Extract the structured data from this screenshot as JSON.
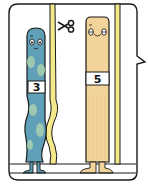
{
  "panel": {
    "type": "comic-illustration",
    "frame": "speech-bubble-panel",
    "colors": {
      "outline": "#1a1a1a",
      "pole": "#f3e98a",
      "blue_body": "#5f9fb8",
      "blue_spots": "#9ec9b0",
      "tan_body": "#f2d49a",
      "tan_stripes": "#e9c383",
      "background": "#ffffff"
    }
  },
  "characters": [
    {
      "name": "blue-wavy-character",
      "number": "3",
      "shape": "wavy"
    },
    {
      "name": "tan-straight-character",
      "number": "5",
      "shape": "straight"
    }
  ],
  "icons": {
    "scissors": "scissors-icon"
  }
}
